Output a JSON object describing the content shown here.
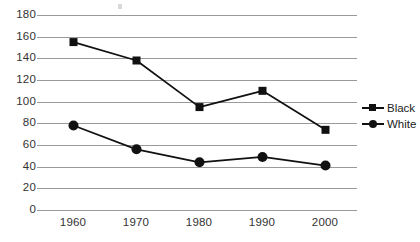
{
  "chart_data": {
    "type": "line",
    "title": "",
    "subtitle": "",
    "xlabel": "",
    "ylabel": "",
    "categories": [
      "1960",
      "1970",
      "1980",
      "1990",
      "2000"
    ],
    "x": [
      1960,
      1970,
      1980,
      1990,
      2000
    ],
    "series": [
      {
        "name": "Black",
        "marker": "square",
        "color": "#111111",
        "values": [
          155,
          138,
          95,
          110,
          74
        ]
      },
      {
        "name": "White",
        "marker": "circle",
        "color": "#111111",
        "values": [
          78,
          56,
          44,
          49,
          41
        ]
      }
    ],
    "ylim": [
      0,
      180
    ],
    "yticks": [
      180,
      160,
      140,
      120,
      100,
      80,
      60,
      40,
      20,
      0
    ],
    "ytick_labels": [
      "180",
      "160",
      "140",
      "120",
      "100",
      "80",
      "60",
      "40",
      "20",
      "0"
    ],
    "xtick_labels": [
      "1960",
      "1970",
      "1980",
      "1990",
      "2000"
    ],
    "grid": "horizontal",
    "grid_color": "#9a9a9a",
    "legend_position": "right",
    "legend": [
      {
        "label": "Black",
        "marker": "square"
      },
      {
        "label": "White",
        "marker": "circle"
      }
    ],
    "background": "#ffffff"
  }
}
